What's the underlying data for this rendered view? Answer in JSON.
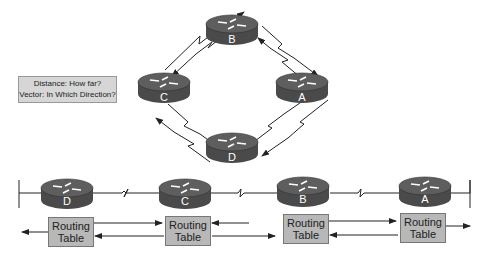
{
  "legend": {
    "line1": "Distance: How far?",
    "line2": "Vector: In Which Direction?"
  },
  "ring_routers": [
    {
      "id": "B",
      "label": "B"
    },
    {
      "id": "A",
      "label": "A"
    },
    {
      "id": "C",
      "label": "C"
    },
    {
      "id": "D",
      "label": "D"
    }
  ],
  "chain_routers": [
    {
      "id": "D",
      "label": "D"
    },
    {
      "id": "C",
      "label": "C"
    },
    {
      "id": "B",
      "label": "B"
    },
    {
      "id": "A",
      "label": "A"
    }
  ],
  "routing_tables": [
    {
      "line1": "Routing",
      "line2": "Table"
    },
    {
      "line1": "Routing",
      "line2": "Table"
    },
    {
      "line1": "Routing",
      "line2": "Table"
    },
    {
      "line1": "Routing",
      "line2": "Table"
    }
  ],
  "colors": {
    "router_body": "#4a4a4a",
    "router_top": "#5e5e5e",
    "table_fill": "#b8b8b8",
    "line": "#222222"
  }
}
